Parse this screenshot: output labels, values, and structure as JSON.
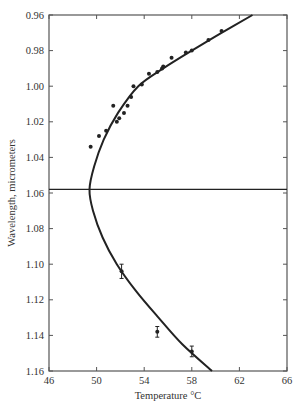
{
  "chart_data": {
    "type": "scatter",
    "title": "",
    "xlabel": "Temperature °C",
    "ylabel": "Wavelength, micrometers",
    "xlim": [
      46,
      66
    ],
    "ylim": [
      1.16,
      0.96
    ],
    "y_inverted": true,
    "x_ticks": [
      46,
      50,
      54,
      58,
      62,
      66
    ],
    "x_tick_labels": [
      "46",
      "50",
      "54",
      "58",
      "62",
      "66"
    ],
    "y_ticks": [
      0.96,
      0.98,
      1.0,
      1.02,
      1.04,
      1.06,
      1.08,
      1.1,
      1.12,
      1.14,
      1.16
    ],
    "y_tick_labels": [
      "0.96",
      "0.98",
      "1.00",
      "1.02",
      "1.04",
      "1.06",
      "1.08",
      "1.10",
      "1.12",
      "1.14",
      "1.16"
    ],
    "grid": false,
    "legend": null,
    "series": [
      {
        "name": "measured points",
        "marker": "dot",
        "points": [
          [
            49.5,
            1.034
          ],
          [
            50.2,
            1.028
          ],
          [
            50.8,
            1.025
          ],
          [
            51.4,
            1.011
          ],
          [
            51.7,
            1.02
          ],
          [
            51.9,
            1.018
          ],
          [
            52.3,
            1.015
          ],
          [
            52.6,
            1.011
          ],
          [
            52.9,
            1.006
          ],
          [
            53.1,
            1.0
          ],
          [
            53.8,
            0.999
          ],
          [
            54.4,
            0.993
          ],
          [
            55.1,
            0.992
          ],
          [
            55.5,
            0.99
          ],
          [
            55.6,
            0.989
          ],
          [
            56.3,
            0.984
          ],
          [
            57.5,
            0.981
          ],
          [
            58.0,
            0.98
          ],
          [
            59.4,
            0.974
          ],
          [
            60.5,
            0.969
          ]
        ]
      },
      {
        "name": "measured points with error bars",
        "marker": "dot-errorbar",
        "points": [
          [
            52.1,
            1.104,
            0.004
          ],
          [
            55.1,
            1.138,
            0.003
          ],
          [
            58.0,
            1.149,
            0.003
          ]
        ]
      },
      {
        "name": "fitted curve",
        "type": "line",
        "vertex": [
          49.4,
          1.058
        ],
        "points": [
          [
            63.1,
            0.96
          ],
          [
            60.5,
            0.97
          ],
          [
            58.0,
            0.98
          ],
          [
            55.6,
            0.99
          ],
          [
            53.5,
            1.0
          ],
          [
            51.8,
            1.015
          ],
          [
            50.6,
            1.03
          ],
          [
            49.8,
            1.045
          ],
          [
            49.4,
            1.058
          ],
          [
            49.7,
            1.07
          ],
          [
            50.5,
            1.085
          ],
          [
            51.7,
            1.1
          ],
          [
            53.3,
            1.115
          ],
          [
            55.2,
            1.13
          ],
          [
            57.2,
            1.145
          ],
          [
            59.7,
            1.16
          ]
        ]
      },
      {
        "name": "horizontal reference line",
        "type": "hline",
        "y": 1.058
      }
    ]
  },
  "colors": {
    "ink": "#222222",
    "axis": "#555555",
    "background": "#ffffff"
  }
}
